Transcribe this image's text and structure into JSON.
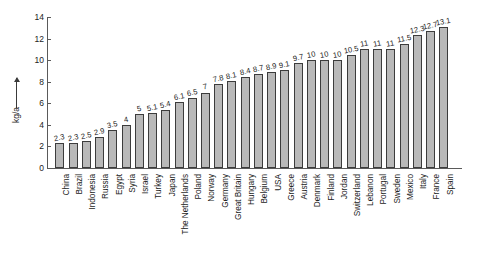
{
  "chart_data": {
    "type": "bar",
    "title": "",
    "xlabel": "",
    "ylabel": "kg/a",
    "ylim": [
      0,
      14
    ],
    "yticks": [
      0,
      2,
      4,
      6,
      8,
      10,
      12,
      14
    ],
    "grid": false,
    "legend": null,
    "orientation": "vertical",
    "bar_color": "#b9b9b9",
    "bar_edge_color": "#3c3c3c",
    "axis_color": "#5a5a5a",
    "categories": [
      "China",
      "Brazil",
      "Indonesia",
      "Russia",
      "Egypt",
      "Syria",
      "Israel",
      "Turkey",
      "Japan",
      "The Netherlands",
      "Poland",
      "Norway",
      "Germany",
      "Great Britain",
      "Hungary",
      "Belgium",
      "USA",
      "Greece",
      "Austria",
      "Denmark",
      "Finland",
      "Jordan",
      "Switzerland",
      "Lebanon",
      "Portugal",
      "Sweden",
      "Mexico",
      "Italy",
      "France",
      "Spain"
    ],
    "values": [
      2.3,
      2.3,
      2.5,
      2.9,
      3.5,
      4,
      5,
      5.1,
      5.4,
      6.1,
      6.5,
      7,
      7.8,
      8.1,
      8.4,
      8.7,
      8.9,
      9.1,
      9.7,
      10,
      10,
      10,
      10.5,
      11,
      11,
      11,
      11.5,
      12.3,
      12.7,
      13.1
    ],
    "value_labels": [
      "2.3",
      "2.3",
      "2.5",
      "2.9",
      "3.5",
      "4",
      "5",
      "5.1",
      "5.4",
      "6.1",
      "6.5",
      "7",
      "7.8",
      "8.1",
      "8.4",
      "8.7",
      "8.9",
      "9.1",
      "9.7",
      "10",
      "10",
      "10",
      "10.5",
      "11",
      "11",
      "11",
      "11.5",
      "12.3",
      "12.7",
      "13.1"
    ],
    "ytick_labels": [
      "0",
      "2",
      "4",
      "6",
      "8",
      "10",
      "12",
      "14"
    ]
  }
}
